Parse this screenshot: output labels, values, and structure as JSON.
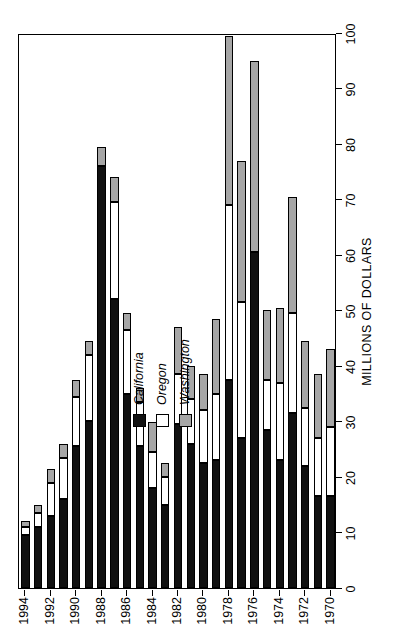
{
  "chart_data": {
    "type": "bar",
    "subtype": "stacked-horizontal-bar",
    "title": "",
    "xlabel": "MILLIONS OF DOLLARS",
    "ylabel": "YEAR",
    "orientation": "horizontal",
    "grid": false,
    "legend_position": "center-left",
    "value_axis": {
      "label": "MILLIONS OF DOLLARS",
      "min": 0,
      "max": 100,
      "tick_step": 10,
      "ticks": [
        0,
        10,
        20,
        30,
        40,
        50,
        60,
        70,
        80,
        90,
        100
      ],
      "tick_labels": [
        "0",
        "10",
        "20",
        "30",
        "40",
        "50",
        "60",
        "70",
        "80",
        "90",
        "100"
      ],
      "direction": "increasing-left"
    },
    "category_axis": {
      "label": "YEAR",
      "tick_labels": [
        "1972",
        "1974",
        "1976",
        "1978",
        "1980",
        "1982",
        "1984",
        "1986",
        "1988",
        "1990",
        "1992",
        "1994"
      ]
    },
    "categories": [
      1970,
      1971,
      1972,
      1973,
      1974,
      1975,
      1976,
      1977,
      1978,
      1979,
      1980,
      1981,
      1982,
      1983,
      1984,
      1985,
      1986,
      1987,
      1988,
      1989,
      1990,
      1991,
      1992,
      1993,
      1994
    ],
    "series": [
      {
        "name": "California",
        "color": "#111111",
        "values": [
          16.5,
          16.5,
          22.0,
          31.5,
          23.0,
          28.5,
          60.5,
          27.0,
          37.5,
          23.0,
          22.5,
          26.0,
          29.5,
          15.0,
          18.0,
          25.5,
          35.0,
          52.0,
          76.0,
          30.0,
          25.5,
          16.0,
          13.0,
          11.0,
          9.5
        ]
      },
      {
        "name": "Oregon",
        "color": "#ffffff",
        "values": [
          12.5,
          10.5,
          10.5,
          18.0,
          14.0,
          9.0,
          0.0,
          24.5,
          31.5,
          12.0,
          9.5,
          8.0,
          9.0,
          5.0,
          6.5,
          8.0,
          11.5,
          17.5,
          0.0,
          12.0,
          9.0,
          7.5,
          6.0,
          2.5,
          1.5
        ]
      },
      {
        "name": "Washington",
        "color": "#a6a6a6",
        "values": [
          14.0,
          11.5,
          12.0,
          21.0,
          13.5,
          12.5,
          34.5,
          25.5,
          30.5,
          13.5,
          6.5,
          6.0,
          8.5,
          2.5,
          5.5,
          2.5,
          3.0,
          4.5,
          3.5,
          2.5,
          3.0,
          2.5,
          2.5,
          1.5,
          1.0
        ]
      }
    ],
    "totals": [
      43.0,
      38.5,
      44.5,
      70.5,
      50.5,
      50.0,
      95.0,
      77.0,
      99.5,
      48.5,
      38.5,
      40.0,
      47.0,
      22.5,
      30.0,
      36.0,
      49.5,
      74.0,
      79.5,
      44.5,
      37.5,
      26.0,
      21.5,
      15.0,
      12.0
    ],
    "legend": [
      {
        "label": "California",
        "swatch": "black"
      },
      {
        "label": "Oregon",
        "swatch": "white"
      },
      {
        "label": "Washington",
        "swatch": "gray"
      }
    ]
  },
  "colors": {
    "california": "#111111",
    "oregon": "#ffffff",
    "washington": "#a6a6a6",
    "axis": "#000000",
    "background": "#ffffff"
  }
}
